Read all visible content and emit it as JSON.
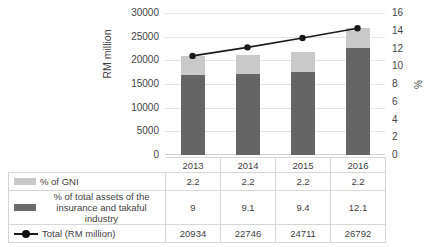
{
  "chart_data": {
    "type": "bar",
    "subtype": "stacked-bar-plus-line combo with data table",
    "categories": [
      "2013",
      "2014",
      "2015",
      "2016"
    ],
    "series": [
      {
        "name": "% of total assets of the insurance and takaful industry",
        "type": "bar",
        "axis": "right",
        "color": "#656565",
        "values": [
          9,
          9.1,
          9.4,
          12.1
        ]
      },
      {
        "name": "% of GNI",
        "type": "bar",
        "axis": "right",
        "color": "#c9c9c9",
        "values": [
          2.2,
          2.2,
          2.2,
          2.2
        ]
      },
      {
        "name": "Total (RM million)",
        "type": "line",
        "axis": "left",
        "color": "#1a1a1a",
        "values": [
          20934,
          22746,
          24711,
          26792
        ]
      }
    ],
    "title": "",
    "xlabel": "",
    "ylabel": "RM million",
    "y2label": "%",
    "ylim": [
      0,
      30000
    ],
    "y2lim": [
      0,
      16
    ],
    "yticks": [
      "0",
      "5000",
      "10000",
      "15000",
      "20000",
      "25000",
      "30000"
    ],
    "y2ticks": [
      "0",
      "2",
      "4",
      "6",
      "8",
      "10",
      "12",
      "14",
      "16"
    ],
    "ytick_values": [
      0,
      5000,
      10000,
      15000,
      20000,
      25000,
      30000
    ],
    "y2tick_values": [
      0,
      2,
      4,
      6,
      8,
      10,
      12,
      14,
      16
    ],
    "grid": true,
    "legend_position": "data-table-left"
  },
  "axes": {
    "left_title": "RM million",
    "right_title": "%"
  },
  "table": {
    "years": [
      "2013",
      "2014",
      "2015",
      "2016"
    ],
    "rows": [
      {
        "legend": "% of GNI",
        "legend_line2": "",
        "marker": "swatch-light",
        "values": [
          "2.2",
          "2.2",
          "2.2",
          "2.2"
        ]
      },
      {
        "legend": "% of total assets of the",
        "legend_line2": "insurance and takaful industry",
        "marker": "swatch-dark",
        "values": [
          "9",
          "9.1",
          "9.4",
          "12.1"
        ]
      },
      {
        "legend": "Total (RM million)",
        "legend_line2": "",
        "marker": "line-marker",
        "values": [
          "20934",
          "22746",
          "24711",
          "26792"
        ]
      }
    ]
  },
  "colors": {
    "bar_light": "#c9c9c9",
    "bar_dark": "#656565",
    "line": "#1a1a1a",
    "grid": "#e4e4e4",
    "table_border": "#d6d6d6",
    "text": "#3f3f3f"
  }
}
